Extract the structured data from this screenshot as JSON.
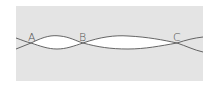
{
  "diagram": {
    "background_color": "#e4e4e4",
    "line_color": "#555555",
    "lens_fill": "#ffffff",
    "labels": [
      {
        "id": "A",
        "text": "A",
        "x": 28,
        "y": 32
      },
      {
        "id": "B",
        "text": "B",
        "x": 79,
        "y": 32
      },
      {
        "id": "C",
        "text": "C",
        "x": 173,
        "y": 32
      }
    ],
    "nodes": [
      {
        "id": "A",
        "x": 31,
        "y": 43
      },
      {
        "id": "B",
        "x": 83,
        "y": 43
      },
      {
        "id": "C",
        "x": 177,
        "y": 43
      }
    ]
  }
}
